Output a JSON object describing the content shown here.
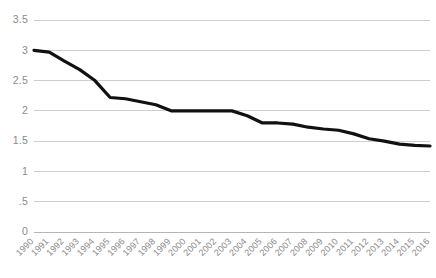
{
  "chart_data": {
    "type": "line",
    "title": "",
    "subtitle": "",
    "xlabel": "",
    "ylabel": "",
    "x": [
      1990,
      1991,
      1992,
      1993,
      1994,
      1995,
      1996,
      1997,
      1998,
      1999,
      2000,
      2001,
      2002,
      2003,
      2004,
      2005,
      2006,
      2007,
      2008,
      2009,
      2010,
      2011,
      2012,
      2013,
      2014,
      2015,
      2016
    ],
    "categories": [
      "1990",
      "1991",
      "1992",
      "1993",
      "1994",
      "1995",
      "1996",
      "1997",
      "1998",
      "1999",
      "2000",
      "2001",
      "2002",
      "2003",
      "2004",
      "2005",
      "2006",
      "2007",
      "2008",
      "2009",
      "2010",
      "2011",
      "2012",
      "2013",
      "2014",
      "2015",
      "2016"
    ],
    "values": [
      3.0,
      2.97,
      2.82,
      2.68,
      2.5,
      2.22,
      2.2,
      2.15,
      2.1,
      2.0,
      2.0,
      2.0,
      2.0,
      2.0,
      1.92,
      1.8,
      1.8,
      1.78,
      1.73,
      1.7,
      1.68,
      1.62,
      1.54,
      1.5,
      1.45,
      1.43,
      1.42
    ],
    "series": [
      {
        "name": "series-1",
        "color": "#111111",
        "values": [
          3.0,
          2.97,
          2.82,
          2.68,
          2.5,
          2.22,
          2.2,
          2.15,
          2.1,
          2.0,
          2.0,
          2.0,
          2.0,
          2.0,
          1.92,
          1.8,
          1.8,
          1.78,
          1.73,
          1.7,
          1.68,
          1.62,
          1.54,
          1.5,
          1.45,
          1.43,
          1.42
        ]
      }
    ],
    "ylim": [
      0,
      3.5
    ],
    "xlim": [
      1990,
      2016
    ],
    "yticks": [
      0,
      0.5,
      1,
      1.5,
      2,
      2.5,
      3,
      3.5
    ],
    "ytick_labels": [
      "0",
      ".5",
      "1",
      "1.5",
      "2",
      "2.5",
      "3",
      "3.5"
    ],
    "grid": true,
    "grid_axis": "y",
    "legend": false,
    "legend_position": "none",
    "annotations": []
  },
  "style": {
    "background": "#ffffff",
    "gridline_color": "#c9c9c9",
    "axis_color": "#b5b5b5",
    "tick_label_color": "#8a8a8a",
    "line_color": "#111111",
    "xtick_rotation_deg": 45
  }
}
